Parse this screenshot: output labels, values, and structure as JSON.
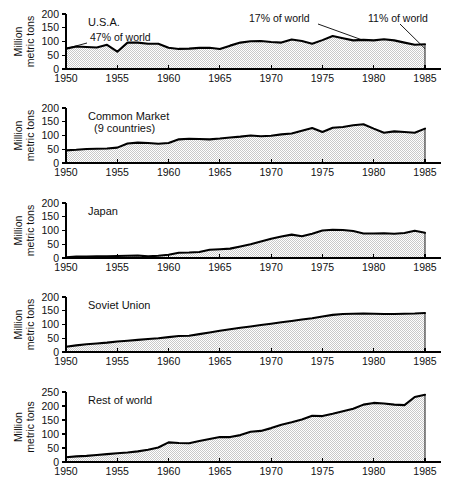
{
  "figure": {
    "width": 459,
    "height": 501,
    "background": "#ffffff",
    "line_color": "#000000",
    "fill_color": "#d9d9d9"
  },
  "axis": {
    "y_label": "Million\nmetric tons",
    "y_label_line1": "Million",
    "y_label_line2": "metric tons",
    "x_ticks": [
      "1950",
      "1955",
      "1960",
      "1965",
      "1970",
      "1975",
      "1980",
      "1985"
    ],
    "y_ticks_standard": [
      "0",
      "50",
      "100",
      "150",
      "200"
    ],
    "y_ticks_tall": [
      "0",
      "50",
      "100",
      "150",
      "200",
      "250"
    ]
  },
  "chart_data": {
    "type": "area",
    "title": "",
    "subtitle": "",
    "xlabel": "",
    "ylabel": "Million metric tons",
    "grid": false,
    "legend_position": "none",
    "xlim": [
      1950,
      1985
    ],
    "x": [
      1950,
      1951,
      1952,
      1953,
      1954,
      1955,
      1956,
      1957,
      1958,
      1959,
      1960,
      1961,
      1962,
      1963,
      1964,
      1965,
      1966,
      1967,
      1968,
      1969,
      1970,
      1971,
      1972,
      1973,
      1974,
      1975,
      1976,
      1977,
      1978,
      1979,
      1980,
      1981,
      1982,
      1983,
      1984,
      1985
    ],
    "panels": [
      {
        "name": "U.S.A.",
        "label": "U.S.A.",
        "ylim": [
          0,
          200
        ],
        "yticks": [
          0,
          50,
          100,
          150,
          200
        ],
        "values": [
          74,
          82,
          80,
          78,
          88,
          63,
          96,
          96,
          92,
          92,
          77,
          73,
          74,
          77,
          77,
          73,
          85,
          96,
          101,
          102,
          98,
          96,
          107,
          102,
          92,
          105,
          120,
          112,
          104,
          106,
          104,
          108,
          104,
          96,
          88,
          90
        ],
        "series_values": [
          74,
          82,
          80,
          78,
          88,
          63,
          96,
          96,
          92,
          92,
          77,
          73,
          74,
          77,
          77,
          73,
          85,
          96,
          101,
          102,
          98,
          96,
          107,
          102,
          92,
          105,
          120,
          112,
          104,
          106,
          104,
          108,
          104,
          96,
          88,
          90
        ],
        "annotations": [
          {
            "text": "47% of world",
            "x_year": 1950,
            "y_value": 74
          },
          {
            "text": "17% of world",
            "x_year": 1979,
            "y_value": 104
          },
          {
            "text": "11% of world",
            "x_year": 1985,
            "y_value": 74
          }
        ]
      },
      {
        "name": "Common Market (9 countries)",
        "label": "Common Market",
        "label_line2": "(9 countries)",
        "ylim": [
          0,
          200
        ],
        "yticks": [
          0,
          50,
          100,
          150,
          200
        ],
        "values": [
          46,
          48,
          51,
          52,
          53,
          56,
          71,
          74,
          73,
          70,
          73,
          86,
          88,
          87,
          86,
          89,
          93,
          96,
          100,
          97,
          99,
          104,
          107,
          117,
          127,
          113,
          128,
          131,
          137,
          141,
          125,
          110,
          115,
          113,
          110,
          125
        ],
        "series_values": [
          46,
          48,
          51,
          52,
          53,
          56,
          71,
          74,
          73,
          70,
          73,
          86,
          88,
          87,
          86,
          89,
          93,
          96,
          100,
          97,
          99,
          104,
          107,
          117,
          127,
          113,
          128,
          131,
          137,
          141,
          125,
          110,
          115,
          113,
          110,
          125
        ],
        "annotations": []
      },
      {
        "name": "Japan",
        "label": "Japan",
        "ylim": [
          0,
          200
        ],
        "yticks": [
          0,
          50,
          100,
          150,
          200
        ],
        "values": [
          3,
          5,
          5,
          6,
          6,
          7,
          8,
          9,
          6,
          8,
          12,
          19,
          20,
          22,
          30,
          32,
          34,
          42,
          50,
          60,
          70,
          78,
          85,
          79,
          88,
          100,
          103,
          102,
          98,
          89,
          89,
          90,
          88,
          91,
          99,
          92
        ],
        "series_values": [
          3,
          5,
          5,
          6,
          6,
          7,
          8,
          9,
          6,
          8,
          12,
          19,
          20,
          22,
          30,
          32,
          34,
          42,
          50,
          60,
          70,
          78,
          85,
          79,
          88,
          100,
          103,
          102,
          98,
          89,
          89,
          90,
          88,
          91,
          99,
          92
        ],
        "annotations": []
      },
      {
        "name": "Soviet Union",
        "label": "Soviet Union",
        "ylim": [
          0,
          200
        ],
        "yticks": [
          0,
          50,
          100,
          150,
          200
        ],
        "values": [
          19,
          24,
          28,
          31,
          34,
          38,
          41,
          44,
          47,
          50,
          54,
          58,
          59,
          65,
          71,
          77,
          83,
          88,
          93,
          98,
          103,
          108,
          113,
          118,
          123,
          129,
          135,
          138,
          139,
          140,
          139,
          138,
          138,
          139,
          140,
          142
        ],
        "series_values": [
          19,
          24,
          28,
          31,
          34,
          38,
          41,
          44,
          47,
          50,
          54,
          58,
          59,
          65,
          71,
          77,
          83,
          88,
          93,
          98,
          103,
          108,
          113,
          118,
          123,
          129,
          135,
          138,
          139,
          140,
          139,
          138,
          138,
          139,
          140,
          142
        ],
        "annotations": []
      },
      {
        "name": "Rest of world",
        "label": "Rest of world",
        "ylim": [
          0,
          250
        ],
        "yticks": [
          0,
          50,
          100,
          150,
          200,
          250
        ],
        "values": [
          17,
          20,
          22,
          25,
          28,
          31,
          34,
          38,
          44,
          52,
          70,
          68,
          67,
          75,
          82,
          89,
          89,
          96,
          108,
          111,
          121,
          133,
          142,
          152,
          165,
          164,
          172,
          181,
          190,
          205,
          211,
          209,
          205,
          203,
          232,
          240
        ],
        "series_values": [
          17,
          20,
          22,
          25,
          28,
          31,
          34,
          38,
          44,
          52,
          70,
          68,
          67,
          75,
          82,
          89,
          89,
          96,
          108,
          111,
          121,
          133,
          142,
          152,
          165,
          164,
          172,
          181,
          190,
          205,
          211,
          209,
          205,
          203,
          232,
          240
        ],
        "annotations": []
      }
    ]
  }
}
